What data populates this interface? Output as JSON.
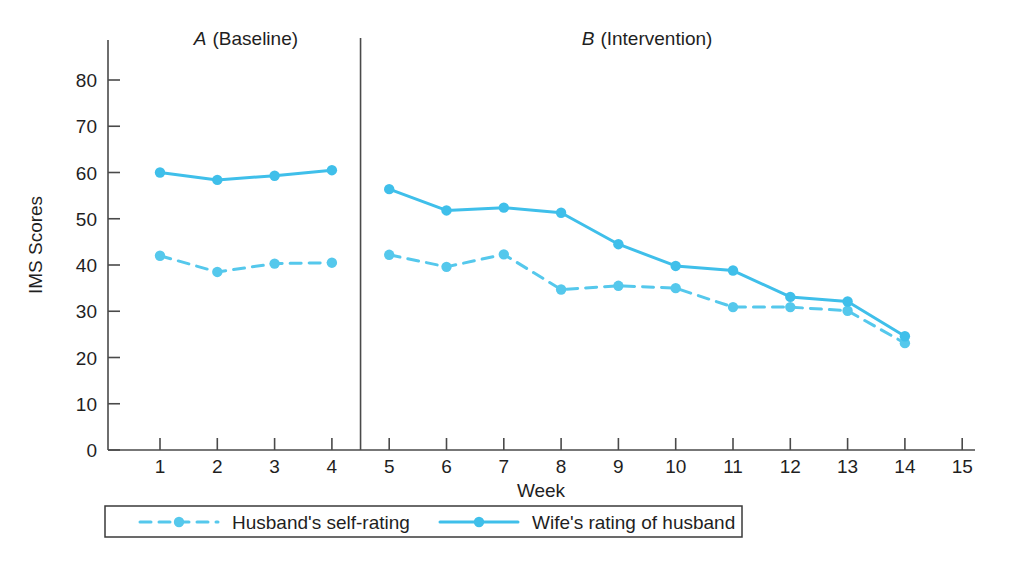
{
  "chart_data": {
    "type": "line",
    "title": "",
    "xlabel": "Week",
    "ylabel": "IMS Scores",
    "xlim": [
      0,
      15
    ],
    "ylim": [
      0,
      80
    ],
    "grid": false,
    "x_ticks": [
      "1",
      "2",
      "3",
      "4",
      "5",
      "6",
      "7",
      "8",
      "9",
      "10",
      "11",
      "12",
      "13",
      "14",
      "15"
    ],
    "x_tick_values": [
      1,
      2,
      3,
      4,
      5,
      6,
      7,
      8,
      9,
      10,
      11,
      12,
      13,
      14,
      15
    ],
    "y_ticks": [
      "0",
      "10",
      "20",
      "30",
      "40",
      "50",
      "60",
      "70",
      "80"
    ],
    "y_tick_values": [
      0,
      10,
      20,
      30,
      40,
      50,
      60,
      70,
      80
    ],
    "legend_position": "below-axis",
    "phases": [
      {
        "id": "A",
        "letter": "A",
        "name": "(Baseline)",
        "label": "A (Baseline)",
        "x_start": 1,
        "x_end": 4
      },
      {
        "id": "B",
        "letter": "B",
        "name": "(Intervention)",
        "label": "B (Intervention)",
        "x_start": 5,
        "x_end": 14
      }
    ],
    "phase_divider_x": 4.5,
    "series": [
      {
        "name": "Husband's self-rating",
        "style": "dashed",
        "color": "#55C8EC",
        "x": [
          1,
          2,
          3,
          4,
          5,
          6,
          7,
          8,
          9,
          10,
          11,
          12,
          13,
          14
        ],
        "values": [
          42.0,
          38.5,
          40.3,
          40.5,
          42.2,
          39.6,
          42.3,
          34.7,
          35.5,
          35.0,
          30.9,
          30.9,
          30.1,
          23.1
        ]
      },
      {
        "name": "Wife's rating of husband",
        "style": "solid",
        "color": "#3FBFEA",
        "x": [
          1,
          2,
          3,
          4,
          5,
          6,
          7,
          8,
          9,
          10,
          11,
          12,
          13,
          14
        ],
        "values": [
          60.0,
          58.4,
          59.3,
          60.5,
          56.4,
          51.8,
          52.4,
          51.3,
          44.5,
          39.8,
          38.8,
          33.1,
          32.1,
          24.6
        ]
      }
    ]
  },
  "colors": {
    "series_primary": "#3FBFEA",
    "series_secondary": "#55C8EC",
    "axis": "#4a4a4a",
    "text": "#1f1f1f"
  }
}
